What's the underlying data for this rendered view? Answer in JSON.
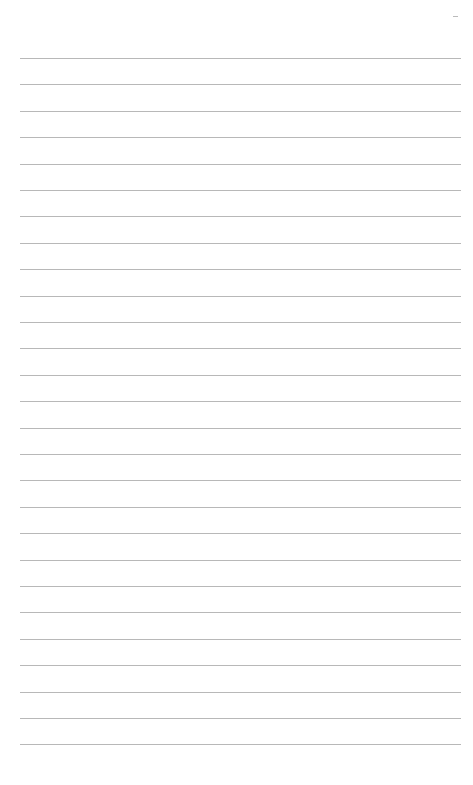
{
  "page": {
    "type": "lined-paper",
    "line_count": 27,
    "first_line_y": 58,
    "line_spacing": 26.4,
    "line_color": "#b8b8b8",
    "background": "#ffffff",
    "corner_mark": "-"
  }
}
